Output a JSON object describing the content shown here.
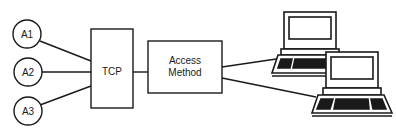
{
  "diagram": {
    "apps": [
      {
        "label": "A1"
      },
      {
        "label": "A2"
      },
      {
        "label": "A3"
      }
    ],
    "tcp": {
      "label": "TCP"
    },
    "access_method": {
      "line1": "Access",
      "line2": "Method"
    },
    "terminals": [
      {
        "name": "terminal-1"
      },
      {
        "name": "terminal-2"
      }
    ],
    "colors": {
      "stroke": "#1a1a1a",
      "fill": "#ffffff"
    }
  }
}
